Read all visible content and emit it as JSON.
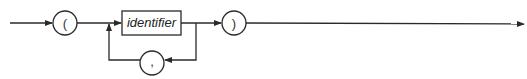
{
  "diagram": {
    "type": "syntax-railroad",
    "nodes": [
      {
        "id": "open-paren",
        "kind": "terminal",
        "label": "("
      },
      {
        "id": "identifier",
        "kind": "nonterminal",
        "label": "identifier"
      },
      {
        "id": "comma",
        "kind": "terminal",
        "label": ","
      },
      {
        "id": "close-paren",
        "kind": "terminal",
        "label": ")"
      }
    ],
    "edges": [
      {
        "from": "start",
        "to": "open-paren"
      },
      {
        "from": "open-paren",
        "to": "identifier"
      },
      {
        "from": "identifier",
        "to": "close-paren"
      },
      {
        "from": "identifier",
        "to": "comma",
        "note": "loop back"
      },
      {
        "from": "comma",
        "to": "identifier",
        "note": "repeat"
      },
      {
        "from": "close-paren",
        "to": "end"
      }
    ]
  }
}
